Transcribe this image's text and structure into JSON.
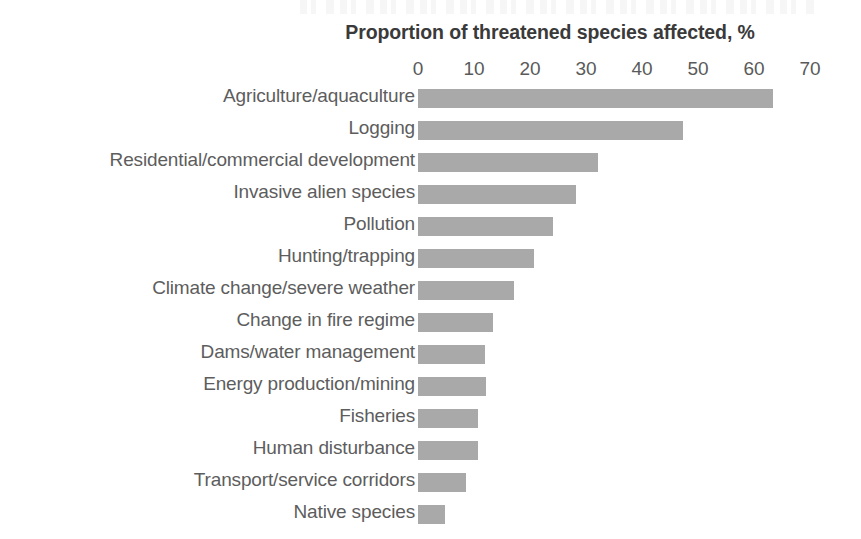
{
  "chart_data": {
    "type": "bar",
    "orientation": "horizontal",
    "title": "Proportion of threatened species affected, %",
    "xlabel": "",
    "ylabel": "",
    "xlim": [
      0,
      70
    ],
    "xticks": [
      0,
      10,
      20,
      30,
      40,
      50,
      60,
      70
    ],
    "xtick_labels": [
      "0",
      "10",
      "20",
      "30",
      "40",
      "50",
      "60",
      "70"
    ],
    "grid": false,
    "legend": null,
    "bar_color": "#a9a9a9",
    "text_color": "#5d5d5d",
    "background_color": "#ffffff",
    "categories": [
      "Agriculture/aquaculture",
      "Logging",
      "Residential/commercial development",
      "Invasive alien species",
      "Pollution",
      "Hunting/trapping",
      "Climate change/severe weather",
      "Change in fire regime",
      "Dams/water management",
      "Energy production/mining",
      "Fisheries",
      "Human disturbance",
      "Transport/service corridors",
      "Native species"
    ],
    "values": [
      63.4,
      47.3,
      32.1,
      28.2,
      24.1,
      20.7,
      17.1,
      13.4,
      11.9,
      12.1,
      10.7,
      10.7,
      8.6,
      4.8
    ]
  }
}
